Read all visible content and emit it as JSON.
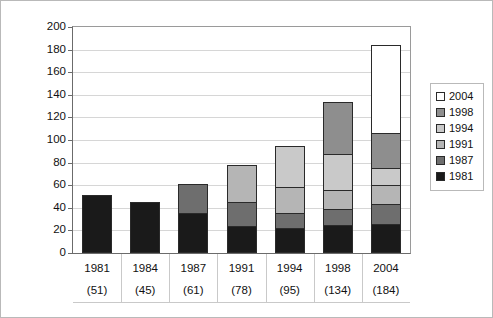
{
  "chart_data": {
    "type": "bar",
    "subtype": "stacked-column",
    "title": "",
    "xlabel": "",
    "ylabel": "",
    "categories": [
      "1981",
      "1984",
      "1987",
      "1991",
      "1994",
      "1998",
      "2004"
    ],
    "category_totals": [
      51,
      45,
      61,
      78,
      95,
      134,
      184
    ],
    "category_total_labels": [
      "(51)",
      "(45)",
      "(61)",
      "(78)",
      "(95)",
      "(134)",
      "(184)"
    ],
    "series": [
      {
        "name": "1981",
        "color": "#1a1a1a",
        "values": [
          51,
          45,
          35,
          24,
          22,
          25,
          26
        ]
      },
      {
        "name": "1987",
        "color": "#6e6e6e",
        "values": [
          0,
          0,
          26,
          21,
          13,
          14,
          17
        ]
      },
      {
        "name": "1991",
        "color": "#b5b5b5",
        "values": [
          0,
          0,
          0,
          33,
          23,
          17,
          17
        ]
      },
      {
        "name": "1994",
        "color": "#c9c9c9",
        "values": [
          0,
          0,
          0,
          0,
          37,
          32,
          15
        ]
      },
      {
        "name": "1998",
        "color": "#8e8e8e",
        "values": [
          0,
          0,
          0,
          0,
          0,
          46,
          31
        ]
      },
      {
        "name": "2004",
        "color": "#ffffff",
        "values": [
          0,
          0,
          0,
          0,
          0,
          0,
          78
        ]
      }
    ],
    "legend_order_top_to_bottom": [
      "2004",
      "1998",
      "1994",
      "1991",
      "1987",
      "1981"
    ],
    "ylim": [
      0,
      200
    ],
    "ytick_step": 20,
    "yticks": [
      "0",
      "20",
      "40",
      "60",
      "80",
      "100",
      "120",
      "140",
      "160",
      "180",
      "200"
    ],
    "grid": true,
    "grid_axis": "y",
    "legend_position": "right"
  },
  "legend": {
    "items": [
      {
        "label": "2004",
        "swatch": "legend-swatch-2004"
      },
      {
        "label": "1998",
        "swatch": "legend-swatch-1998"
      },
      {
        "label": "1994",
        "swatch": "legend-swatch-1994"
      },
      {
        "label": "1991",
        "swatch": "legend-swatch-1991"
      },
      {
        "label": "1987",
        "swatch": "legend-swatch-1987"
      },
      {
        "label": "1981",
        "swatch": "legend-swatch-1981"
      }
    ]
  }
}
